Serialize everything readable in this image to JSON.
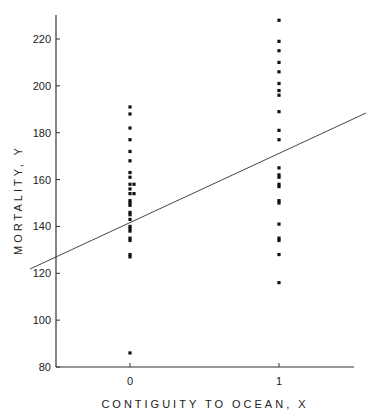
{
  "chart_data": {
    "type": "scatter",
    "title": "",
    "xlabel": "CONTIGUITY TO OCEAN, X",
    "ylabel": "MORTALITY, Y",
    "xlim": [
      -0.5,
      1.5
    ],
    "ylim": [
      80,
      230
    ],
    "x_ticks": [
      0,
      1
    ],
    "x_tick_labels": [
      "0",
      "1"
    ],
    "y_ticks": [
      80,
      100,
      120,
      140,
      160,
      180,
      200,
      220
    ],
    "y_tick_labels": [
      "80",
      "100",
      "120",
      "140",
      "160",
      "180",
      "200",
      "220"
    ],
    "grid": false,
    "legend": null,
    "series": [
      {
        "name": "Not contiguous to ocean (X=0)",
        "x": 0,
        "values": [
          191,
          188,
          182,
          177,
          172,
          168,
          163,
          161,
          158,
          158,
          156,
          154,
          154,
          151,
          150,
          149,
          146,
          145,
          143,
          140,
          139,
          138,
          135,
          134,
          128,
          127,
          86
        ]
      },
      {
        "name": "Contiguous to ocean (X=1)",
        "x": 1,
        "values": [
          228,
          219,
          215,
          210,
          206,
          201,
          198,
          196,
          189,
          181,
          177,
          165,
          162,
          161,
          158,
          157,
          151,
          150,
          141,
          135,
          134,
          128,
          116
        ]
      },
      {
        "name": "Fitted regression line",
        "type": "line",
        "x": [
          -0.5,
          1.5
        ],
        "values": [
          123,
          189
        ]
      }
    ]
  }
}
